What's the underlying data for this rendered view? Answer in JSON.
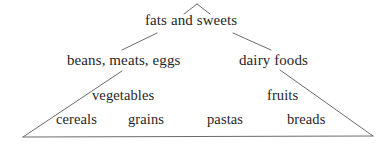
{
  "diagram": {
    "type": "pyramid",
    "background_color": "#ffffff",
    "line_color": "#6b6b6b",
    "text_color": "#262626",
    "tiers": [
      {
        "level": 1,
        "labels": [
          "fats and sweets"
        ]
      },
      {
        "level": 2,
        "labels": [
          "beans, meats, eggs",
          "dairy foods"
        ]
      },
      {
        "level": 3,
        "labels": [
          "vegetables",
          "fruits"
        ]
      },
      {
        "level": 4,
        "labels": [
          "cereals",
          "grains",
          "pastas",
          "breads"
        ]
      }
    ],
    "labels": {
      "fats_and_sweets": "fats and sweets",
      "beans_meats_eggs": "beans, meats, eggs",
      "dairy_foods": "dairy foods",
      "vegetables": "vegetables",
      "fruits": "fruits",
      "cereals": "cereals",
      "grains": "grains",
      "pastas": "pastas",
      "breads": "breads"
    },
    "strokes": {
      "apex_left": "apex-left-stroke",
      "apex_right": "apex-right-stroke",
      "connector_left": "connector-left-stroke",
      "connector_right": "connector-right-stroke",
      "side_left": "pyramid-left-side",
      "side_right": "pyramid-right-side",
      "base": "pyramid-base-line"
    }
  }
}
